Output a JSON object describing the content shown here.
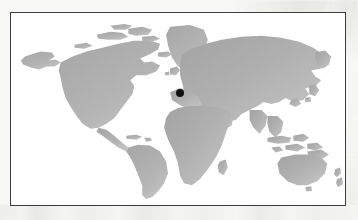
{
  "figure": {
    "type": "locator-map",
    "width": 358,
    "height": 220,
    "background_color": "#f8f8f7"
  },
  "frame": {
    "border_color": "#3c3c3e",
    "border_width_px": 1.4,
    "fill_color": "#ffffff",
    "x": 10,
    "y": 12,
    "width": 336,
    "height": 194
  },
  "map": {
    "projection": "equirectangular",
    "land_color": "#a9a9a9",
    "land_color_light": "#c4c4c4",
    "ocean_color": "#ffffff",
    "graticule_visible": false,
    "labels_visible": false,
    "regions": [
      {
        "name": "North America",
        "visible": true
      },
      {
        "name": "Greenland",
        "visible": true
      },
      {
        "name": "South America",
        "visible": true
      },
      {
        "name": "Europe",
        "visible": true
      },
      {
        "name": "Africa",
        "visible": true
      },
      {
        "name": "Asia",
        "visible": true
      },
      {
        "name": "Australia",
        "visible": true
      },
      {
        "name": "New Zealand",
        "visible": true
      },
      {
        "name": "Indonesia",
        "visible": true
      },
      {
        "name": "Japan",
        "visible": true
      },
      {
        "name": "British Isles",
        "visible": true
      },
      {
        "name": "Iceland",
        "visible": true
      },
      {
        "name": "Madagascar",
        "visible": true
      },
      {
        "name": "Antarctica",
        "visible": false
      }
    ]
  },
  "marker": {
    "shape": "circle",
    "color": "#111111",
    "diameter_px": 8,
    "x": 180,
    "y": 93,
    "region_hint": "Southeastern Europe / Adriatic - Balkans",
    "label": ""
  },
  "chart_data": {
    "type": "scatter",
    "title": "",
    "xlabel": "",
    "ylabel": "",
    "x": [
      180
    ],
    "y": [
      93
    ],
    "values": [
      1
    ],
    "categories": [
      "marked location"
    ],
    "xlim": [
      10,
      346
    ],
    "ylim": [
      12,
      206
    ],
    "grid": false,
    "legend": "none"
  }
}
